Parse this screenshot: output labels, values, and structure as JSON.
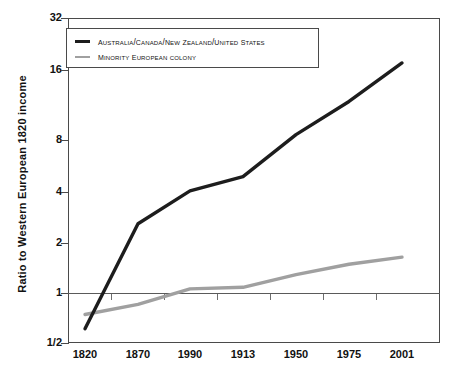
{
  "chart_data": {
    "type": "line",
    "title": "",
    "xlabel": "",
    "ylabel": "Ratio to Western European 1820 income",
    "yscale": "log2",
    "ylim": [
      0.5,
      32
    ],
    "ytick_labels": [
      "32",
      "16",
      "8",
      "4",
      "2",
      "1",
      "1/2"
    ],
    "ytick_values": [
      32,
      16,
      8,
      4,
      2,
      1,
      0.5
    ],
    "categories": [
      "1820",
      "1870",
      "1990",
      "1913",
      "1950",
      "1975",
      "2001"
    ],
    "grid": false,
    "reference_line": {
      "value": 1,
      "label": "1"
    },
    "legend_position": "upper-left",
    "series": [
      {
        "name": "Australia/Canada/New Zealand/United States",
        "color": "#1d1d1d",
        "values": [
          0.6,
          2.3,
          3.5,
          4.2,
          7.2,
          11.0,
          18.0
        ]
      },
      {
        "name": "Minority European colony",
        "color": "#a0a0a0",
        "values": [
          0.72,
          0.82,
          1.0,
          1.02,
          1.2,
          1.37,
          1.5
        ]
      }
    ]
  },
  "axes": {
    "y_ticks": [
      {
        "label": "32",
        "y": 18
      },
      {
        "label": "16",
        "y": 70
      },
      {
        "label": "8",
        "y": 140
      },
      {
        "label": "4",
        "y": 192
      },
      {
        "label": "2",
        "y": 243
      },
      {
        "label": "1",
        "y": 293
      },
      {
        "label": "1/2",
        "y": 343
      }
    ],
    "x_ticks": [
      {
        "label": "1820",
        "x": 85
      },
      {
        "label": "1870",
        "x": 138
      },
      {
        "label": "1990",
        "x": 190
      },
      {
        "label": "1913",
        "x": 243
      },
      {
        "label": "1950",
        "x": 296
      },
      {
        "label": "1975",
        "x": 349
      },
      {
        "label": "2001",
        "x": 402
      }
    ],
    "reference_tick_x": [
      111,
      164,
      217,
      270,
      323,
      376
    ]
  },
  "legend": {
    "items": [
      {
        "lead": "A",
        "rest": "ustralia/",
        "full": "Australia/Canada/New Zealand/United States",
        "color": "#1d1d1d",
        "swatch": "thick"
      },
      {
        "lead": "M",
        "rest": "inority",
        "full": "Minority European colony",
        "color": "#a0a0a0",
        "swatch": "thin"
      }
    ],
    "item_0_label": "Australia/Canada/New Zealand/United States",
    "item_1_label": "Minority European colony"
  },
  "colors": {
    "series_black": "#1d1d1d",
    "series_gray": "#a0a0a0",
    "axis": "#4a4a4a",
    "text": "#111111",
    "background": "#ffffff"
  }
}
